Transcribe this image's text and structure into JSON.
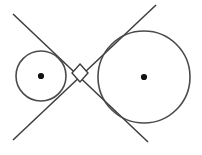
{
  "figure": {
    "background_color": "#ffffff",
    "stroke_color": "#4a4a4a",
    "dot_color": "#111111",
    "canvas": {
      "width": 202,
      "height": 155
    },
    "labels": {
      "small_circle": "small-circle",
      "large_circle": "large-circle",
      "small_center": "small-circle-center-point",
      "large_center": "large-circle-center-point",
      "tangent_a": "tangent-line-upper-left-to-lower-right",
      "tangent_b": "tangent-line-lower-left-to-upper-right",
      "right_angle": "right-angle-marker"
    }
  },
  "chart_data": {
    "type": "scatter",
    "xlabel": "",
    "ylabel": "",
    "xlim": [
      0,
      202
    ],
    "ylim": [
      0,
      155
    ],
    "grid": false,
    "legend": "none",
    "shapes": [
      {
        "name": "small-circle",
        "kind": "circle",
        "cx": 41,
        "cy": 76,
        "r": 25,
        "stroke": "#4a4a4a",
        "stroke_width": 1.6,
        "fill": "none"
      },
      {
        "name": "large-circle",
        "kind": "circle",
        "cx": 144,
        "cy": 77,
        "r": 46,
        "stroke": "#4a4a4a",
        "stroke_width": 1.6,
        "fill": "none"
      },
      {
        "name": "small-circle-center-point",
        "kind": "dot",
        "cx": 41,
        "cy": 76,
        "r": 3.1,
        "fill": "#111111"
      },
      {
        "name": "large-circle-center-point",
        "kind": "dot",
        "cx": 144,
        "cy": 77,
        "r": 3.1,
        "fill": "#111111"
      },
      {
        "name": "tangent-line-upper-left-to-lower-right",
        "kind": "line",
        "x1": 13,
        "y1": 14,
        "x2": 148,
        "y2": 142,
        "stroke": "#3c3c3c",
        "stroke_width": 1.5
      },
      {
        "name": "tangent-line-lower-left-to-upper-right",
        "kind": "line",
        "x1": 13,
        "y1": 140,
        "x2": 156,
        "y2": 5,
        "stroke": "#3c3c3c",
        "stroke_width": 1.5
      },
      {
        "name": "right-angle-marker",
        "kind": "polygon",
        "points": "80,64 88,73 80,82 72,73",
        "stroke": "#3c3c3c",
        "stroke_width": 1.4,
        "fill": "#ffffff"
      }
    ],
    "points": [
      {
        "label": "small-circle-center",
        "x": 41,
        "y": 76
      },
      {
        "label": "large-circle-center",
        "x": 144,
        "y": 77
      },
      {
        "label": "tangent-intersection",
        "x": 80,
        "y": 73
      }
    ]
  }
}
